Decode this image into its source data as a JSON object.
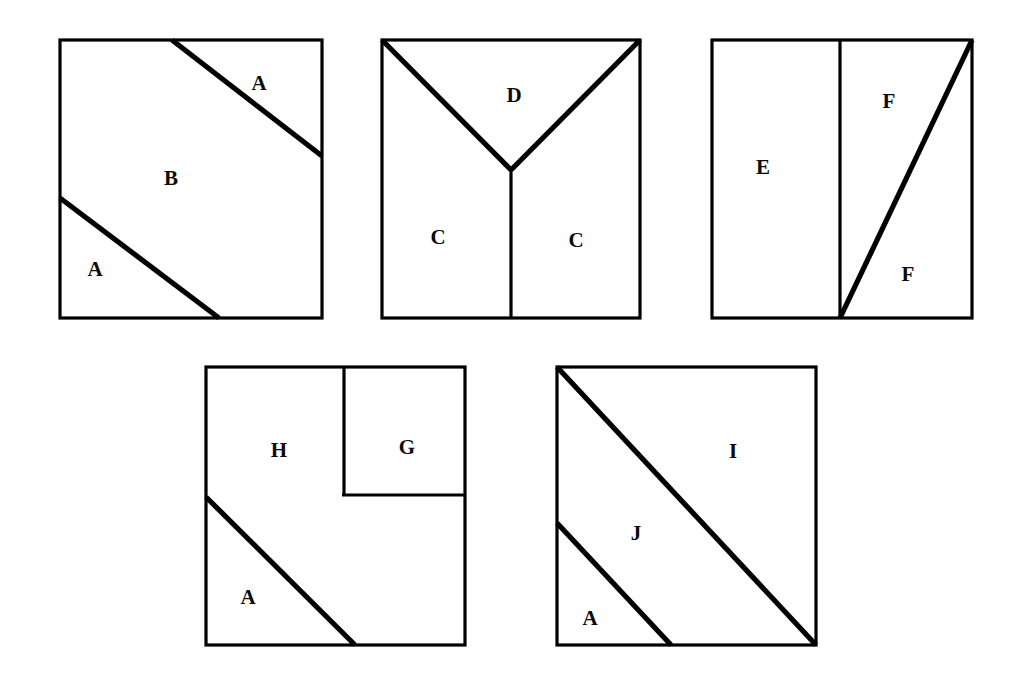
{
  "figure": {
    "background_color": "#ffffff",
    "line_color": "#000000",
    "title": "",
    "squares": [
      {
        "id": "square-1",
        "position": "top-left",
        "labels": [
          "A",
          "B",
          "A"
        ],
        "description": "Square cut by two parallel diagonal lines forming two corner triangles labeled A and a central hexagon labeled B"
      },
      {
        "id": "square-2",
        "position": "top-center",
        "labels": [
          "D",
          "C",
          "C"
        ],
        "description": "Square cut by a Y shape: two diagonals from the top corners meeting at center, then a vertical line to the bottom edge"
      },
      {
        "id": "square-3",
        "position": "top-right",
        "labels": [
          "E",
          "F",
          "F"
        ],
        "description": "Square cut by a vertical line and a diagonal from the vertical line's base to the top-right corner"
      },
      {
        "id": "square-4",
        "position": "bottom-left",
        "labels": [
          "H",
          "G",
          "A"
        ],
        "description": "Square with an inset square G at the top right and a diagonal cut in the lower left forming triangle A"
      },
      {
        "id": "square-5",
        "position": "bottom-right",
        "labels": [
          "I",
          "J",
          "A"
        ],
        "description": "Square cut by two parallel diagonals: the main diagonal and a shorter parallel one near the bottom-left corner"
      }
    ],
    "region_labels": [
      {
        "name": "label-a-1",
        "text": "A",
        "x": 259,
        "y": 83,
        "square": "square-1"
      },
      {
        "name": "label-b-1",
        "text": "B",
        "x": 171,
        "y": 178,
        "square": "square-1"
      },
      {
        "name": "label-a-2",
        "text": "A",
        "x": 95,
        "y": 269,
        "square": "square-1"
      },
      {
        "name": "label-d",
        "text": "D",
        "x": 514,
        "y": 95,
        "square": "square-2"
      },
      {
        "name": "label-c-1",
        "text": "C",
        "x": 438,
        "y": 237,
        "square": "square-2"
      },
      {
        "name": "label-c-2",
        "text": "C",
        "x": 576,
        "y": 240,
        "square": "square-2"
      },
      {
        "name": "label-e",
        "text": "E",
        "x": 763,
        "y": 167,
        "square": "square-3"
      },
      {
        "name": "label-f-1",
        "text": "F",
        "x": 889,
        "y": 101,
        "square": "square-3"
      },
      {
        "name": "label-f-2",
        "text": "F",
        "x": 908,
        "y": 274,
        "square": "square-3"
      },
      {
        "name": "label-h",
        "text": "H",
        "x": 279,
        "y": 450,
        "square": "square-4"
      },
      {
        "name": "label-g",
        "text": "G",
        "x": 407,
        "y": 447,
        "square": "square-4"
      },
      {
        "name": "label-a-3",
        "text": "A",
        "x": 248,
        "y": 597,
        "square": "square-4"
      },
      {
        "name": "label-i",
        "text": "I",
        "x": 733,
        "y": 451,
        "square": "square-5"
      },
      {
        "name": "label-j",
        "text": "J",
        "x": 636,
        "y": 533,
        "square": "square-5"
      },
      {
        "name": "label-a-4",
        "text": "A",
        "x": 590,
        "y": 618,
        "square": "square-5"
      }
    ]
  }
}
